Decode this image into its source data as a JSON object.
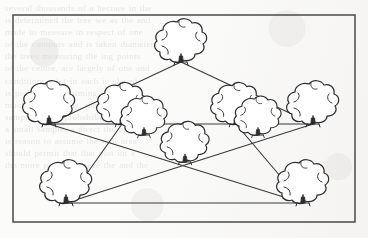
{
  "page": {
    "kind": "scanned-book-figure",
    "background_color": "#fbfbfa",
    "ink_color": "#2a2a2a",
    "frame_color": "#4a4a4a",
    "line_color": "#3a3a3a",
    "bleed_text_color": "#7a7d7e"
  },
  "show_through_text": {
    "note": "faint mirrored text bleeding through from the reverse page, largely illegible",
    "lines": [
      "several thousands of a hectare in the",
      "is determined the tree we as the and",
      "made to measure in respect of one",
      "of the contours and is taken diameter",
      "the trees measuring the ing points",
      "of the centre, are largely of one and",
      "conditions, plot in each is placed",
      "is probability assuming it and and",
      "much of surveying, the the more",
      "sampling with probability extra proper",
      "a small sample, a direct the ability",
      "is reason to assume the root area",
      "should permit that that plot on a",
      "the more precise a gave the and the"
    ]
  },
  "figure": {
    "caption": "",
    "frame": {
      "x": 13,
      "y": 15,
      "width": 342,
      "height": 207
    },
    "type": "tree-survey-diagram",
    "trees": [
      {
        "id": "t-apex",
        "label": "apex tree",
        "x": 181,
        "y": 62,
        "scale": 1.0
      },
      {
        "id": "t-left-upper",
        "label": "left upper tree",
        "x": 49,
        "y": 124,
        "scale": 1.0
      },
      {
        "id": "t-mid-left",
        "label": "mid left tree",
        "x": 122,
        "y": 124,
        "scale": 0.96
      },
      {
        "id": "t-mid-right",
        "label": "mid right tree",
        "x": 236,
        "y": 124,
        "scale": 0.96
      },
      {
        "id": "t-right-upper",
        "label": "right upper tree",
        "x": 313,
        "y": 124,
        "scale": 1.0
      },
      {
        "id": "t-inner-left",
        "label": "inner left tree",
        "x": 144,
        "y": 135,
        "scale": 0.9
      },
      {
        "id": "t-inner-right",
        "label": "inner right tree",
        "x": 258,
        "y": 135,
        "scale": 0.9
      },
      {
        "id": "t-centre",
        "label": "centre tree",
        "x": 185,
        "y": 162,
        "scale": 0.94
      },
      {
        "id": "t-bottom-left",
        "label": "bottom left tree",
        "x": 66,
        "y": 203,
        "scale": 1.0
      },
      {
        "id": "t-bottom-right",
        "label": "bottom right tree",
        "x": 303,
        "y": 203,
        "scale": 1.0
      }
    ],
    "survey_lines": [
      {
        "id": "l-apex-left",
        "from": "t-apex",
        "to": "t-left-upper"
      },
      {
        "id": "l-apex-right",
        "from": "t-apex",
        "to": "t-right-upper"
      },
      {
        "id": "l-horizontal",
        "from": "t-left-upper",
        "to": "t-right-upper"
      },
      {
        "id": "l-diag-down-right",
        "from": "t-left-upper",
        "to": "t-bottom-right"
      },
      {
        "id": "l-diag-down-left",
        "from": "t-right-upper",
        "to": "t-bottom-left"
      },
      {
        "id": "l-base",
        "from": "t-bottom-left",
        "to": "t-bottom-right"
      },
      {
        "id": "l-midleft-bl",
        "from": "t-mid-left",
        "to": "t-bottom-left"
      },
      {
        "id": "l-midright-br",
        "from": "t-mid-right",
        "to": "t-bottom-right"
      }
    ]
  }
}
